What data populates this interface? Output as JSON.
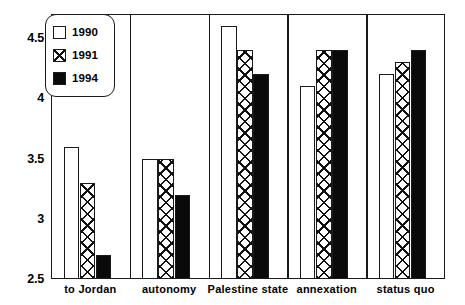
{
  "chart_data": {
    "type": "bar",
    "title": "",
    "xlabel": "",
    "ylabel": "",
    "ylim": [
      2.5,
      4.7
    ],
    "yticks": [
      2.5,
      3,
      3.5,
      4,
      4.5
    ],
    "ytick_labels": [
      "2.5",
      "3",
      "3.5",
      "4",
      "4.5"
    ],
    "grid": false,
    "legend_position": "top-left-inside",
    "categories": [
      "to Jordan",
      "autonomy",
      "Palestine state",
      "annexation",
      "status quo"
    ],
    "series": [
      {
        "name": "1990",
        "values": [
          3.6,
          3.5,
          4.6,
          4.1,
          4.2
        ],
        "fill": "white",
        "color": "#ffffff"
      },
      {
        "name": "1991",
        "values": [
          3.3,
          3.5,
          4.4,
          4.4,
          4.3
        ],
        "fill": "cross-hatch",
        "color": "#ffffff"
      },
      {
        "name": "1994",
        "values": [
          2.7,
          3.2,
          4.2,
          4.4,
          4.4
        ],
        "fill": "solid-black",
        "color": "#0a0a0a"
      }
    ]
  },
  "legend": {
    "items": [
      {
        "label": "1990",
        "swatch": "white-square-swatch"
      },
      {
        "label": "1991",
        "swatch": "cross-hatch-square-swatch"
      },
      {
        "label": "1994",
        "swatch": "black-square-swatch"
      }
    ]
  }
}
